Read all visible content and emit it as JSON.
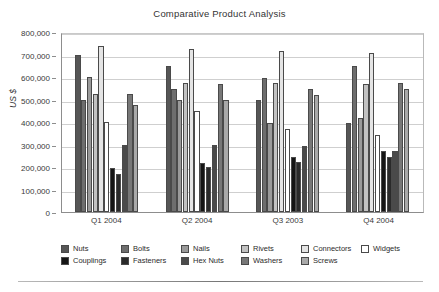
{
  "chart_data": {
    "type": "bar",
    "title": "Comparative Product Analysis",
    "xlabel": "",
    "ylabel": "US $",
    "ylim": [
      0,
      800000
    ],
    "yticks": [
      0,
      100000,
      200000,
      300000,
      400000,
      500000,
      600000,
      700000,
      800000
    ],
    "ytick_labels": [
      "0",
      "100,000",
      "200,000",
      "300,000",
      "400,000",
      "500,000",
      "600,000",
      "700,000",
      "800,000"
    ],
    "grid": true,
    "legend_position": "bottom",
    "categories": [
      "Q1 2004",
      "Q2 2004",
      "Q3 2003",
      "Q4 2004"
    ],
    "series": [
      {
        "name": "Nuts",
        "color": "#565656",
        "values": [
          700000,
          648000,
          498000,
          396000
        ]
      },
      {
        "name": "Bolts",
        "color": "#6e6e6e",
        "values": [
          498000,
          548000,
          596000,
          647000
        ]
      },
      {
        "name": "Nails",
        "color": "#9a9a9a",
        "values": [
          600000,
          499000,
          395000,
          420000
        ]
      },
      {
        "name": "Rivets",
        "color": "#c2c2c2",
        "values": [
          525000,
          573000,
          572000,
          570000
        ]
      },
      {
        "name": "Connectors",
        "color": "#e4e4e4",
        "values": [
          739000,
          726000,
          717000,
          705000
        ]
      },
      {
        "name": "Widgets",
        "color": "#ffffff",
        "values": [
          398000,
          447000,
          371000,
          343000
        ]
      },
      {
        "name": "Couplings",
        "color": "#151515",
        "values": [
          197000,
          216000,
          244000,
          271000
        ]
      },
      {
        "name": "Fasteners",
        "color": "#2a2a2a",
        "values": [
          171000,
          198000,
          223000,
          243000
        ]
      },
      {
        "name": "Hex Nuts",
        "color": "#4a4a4a",
        "values": [
          297000,
          296000,
          294000,
          269000
        ]
      },
      {
        "name": "Washers",
        "color": "#777777",
        "values": [
          524000,
          570000,
          548000,
          572000
        ]
      },
      {
        "name": "Screws",
        "color": "#a9a9a9",
        "values": [
          474000,
          497000,
          521000,
          545000
        ]
      }
    ]
  },
  "legend": {
    "rows": [
      [
        "Nuts",
        "Bolts",
        "Nails",
        "Rivets",
        "Connectors",
        "Widgets"
      ],
      [
        "Couplings",
        "Fasteners",
        "Hex Nuts",
        "Washers",
        "Screws"
      ]
    ]
  }
}
